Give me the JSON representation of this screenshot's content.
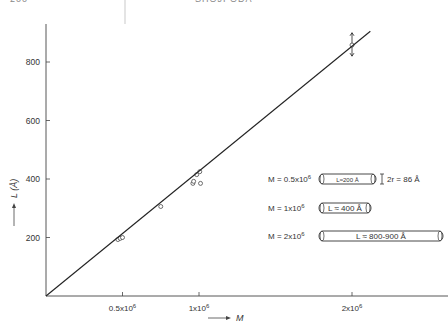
{
  "header": {
    "page_number": "200",
    "running_title": "SHOJI ODA"
  },
  "chart_data": {
    "type": "scatter",
    "title": "",
    "xlabel": "M",
    "ylabel": "L (Å)",
    "x_ticks": [
      {
        "value": 500000,
        "label": "0.5x10^6"
      },
      {
        "value": 1000000,
        "label": "1x10^6"
      },
      {
        "value": 2000000,
        "label": "2x10^6"
      }
    ],
    "y_ticks": [
      {
        "value": 200,
        "label": "200"
      },
      {
        "value": 400,
        "label": "400"
      },
      {
        "value": 600,
        "label": "600"
      },
      {
        "value": 800,
        "label": "800"
      }
    ],
    "xlim": [
      0,
      2600000
    ],
    "ylim": [
      0,
      930
    ],
    "grid": false,
    "series": [
      {
        "name": "measured",
        "marker": "open-circle",
        "points": [
          {
            "x": 470000,
            "y": 193
          },
          {
            "x": 485000,
            "y": 197
          },
          {
            "x": 500000,
            "y": 200
          },
          {
            "x": 750000,
            "y": 306
          },
          {
            "x": 960000,
            "y": 385
          },
          {
            "x": 965000,
            "y": 392
          },
          {
            "x": 985000,
            "y": 415
          },
          {
            "x": 1005000,
            "y": 425
          },
          {
            "x": 1010000,
            "y": 385
          },
          {
            "x": 2000000,
            "y": 858,
            "error_bar": [
              820,
              900
            ]
          }
        ]
      },
      {
        "name": "fit-line",
        "type": "line",
        "points": [
          {
            "x": 0,
            "y": 0
          },
          {
            "x": 2120000,
            "y": 905
          }
        ]
      }
    ],
    "annotations": [
      {
        "m_label": "M = 0.5x10^6",
        "rod_label": "L≈200 Å",
        "extra": "2r = 86 Å"
      },
      {
        "m_label": "M = 1x10^6",
        "rod_label": "L ≈ 400 Å"
      },
      {
        "m_label": "M = 2x10^6",
        "rod_label": "L ≈ 800-900 Å"
      }
    ]
  }
}
